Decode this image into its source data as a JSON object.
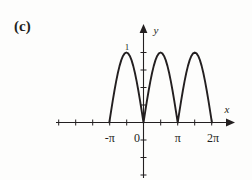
{
  "figure": {
    "panel_label": "(c)",
    "background_color": "#fdfdfc",
    "ink_color": "#231f20"
  },
  "chart_data": {
    "type": "line",
    "title": "",
    "subtitle": "",
    "xlabel": "x",
    "ylabel": "y",
    "function": "y = |sin x|",
    "grid": false,
    "legend": null,
    "xlim": [
      -4.712388,
      7.853982
    ],
    "ylim": [
      -1.6,
      1.55
    ],
    "x_tick_labels": [
      "-π",
      "0",
      "π",
      "2π"
    ],
    "x_tick_values": [
      -3.141593,
      0,
      3.141593,
      6.283185
    ],
    "y_tick_labels": [
      "1"
    ],
    "y_tick_values": [
      1
    ],
    "x_minor_tick_step": 1.570796,
    "y_minor_tick_step": 0.333333,
    "zero_crossings": [
      -3.141593,
      0,
      3.141593,
      6.283185
    ],
    "peaks": [
      {
        "x": -1.570796,
        "y": 1
      },
      {
        "x": 1.570796,
        "y": 1
      },
      {
        "x": 4.712389,
        "y": 1
      }
    ],
    "x": [
      -3.141593,
      -2.984513,
      -2.827433,
      -2.670354,
      -2.513274,
      -2.356194,
      -2.199115,
      -2.042035,
      -1.884956,
      -1.727876,
      -1.570796,
      -1.413717,
      -1.256637,
      -1.099557,
      -0.942478,
      -0.785398,
      -0.628319,
      -0.471239,
      -0.314159,
      -0.15708,
      0,
      0.15708,
      0.314159,
      0.471239,
      0.628319,
      0.785398,
      0.942478,
      1.099557,
      1.256637,
      1.413717,
      1.570796,
      1.727876,
      1.884956,
      2.042035,
      2.199115,
      2.356194,
      2.513274,
      2.670354,
      2.827433,
      2.984513,
      3.141593,
      3.298672,
      3.455752,
      3.612832,
      3.769911,
      3.926991,
      4.08407,
      4.24115,
      4.39823,
      4.555309,
      4.712389,
      4.869469,
      5.026548,
      5.183628,
      5.340708,
      5.497787,
      5.654867,
      5.811947,
      5.969026,
      6.126106,
      6.283185
    ],
    "y": [
      0,
      0.156434,
      0.309017,
      0.45399,
      0.587785,
      0.707107,
      0.809017,
      0.891007,
      0.951057,
      0.987688,
      1,
      0.987688,
      0.951057,
      0.891007,
      0.809017,
      0.707107,
      0.587785,
      0.45399,
      0.309017,
      0.156434,
      0,
      0.156434,
      0.309017,
      0.45399,
      0.587785,
      0.707107,
      0.809017,
      0.891007,
      0.951057,
      0.987688,
      1,
      0.987688,
      0.951057,
      0.891007,
      0.809017,
      0.707107,
      0.587785,
      0.45399,
      0.309017,
      0.156434,
      0,
      0.156434,
      0.309017,
      0.45399,
      0.587785,
      0.707107,
      0.809017,
      0.891007,
      0.951057,
      0.987688,
      1,
      0.987688,
      0.951057,
      0.891007,
      0.809017,
      0.707107,
      0.587785,
      0.45399,
      0.309017,
      0.156434,
      0
    ]
  },
  "axes": {
    "x_axis_label": "x",
    "y_axis_label": "y",
    "x_ticks": [
      {
        "label": "-π",
        "value": -3.141593
      },
      {
        "label": "0",
        "value": 0
      },
      {
        "label": "π",
        "value": 3.141593
      },
      {
        "label": "2π",
        "value": 6.283185
      }
    ],
    "y_ticks": [
      {
        "label": "1",
        "value": 1
      }
    ]
  }
}
